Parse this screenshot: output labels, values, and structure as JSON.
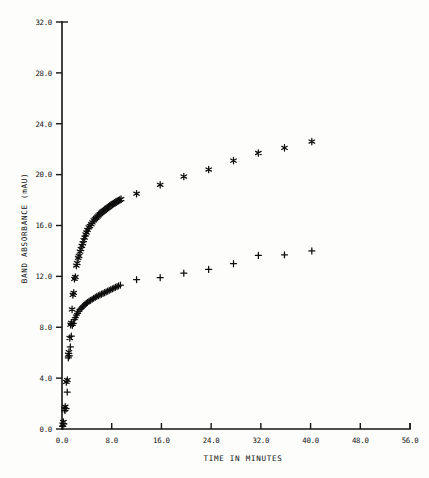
{
  "chart_data": {
    "type": "scatter",
    "title": "",
    "xlabel": "TIME IN MINUTES",
    "ylabel": "BAND ABSORBANCE (mAU)",
    "xlim": [
      0.0,
      56.0
    ],
    "ylim": [
      0.0,
      32.0
    ],
    "xticks": [
      "0.0",
      "8.0",
      "16.0",
      "24.0",
      "32.0",
      "40.0",
      "48.0",
      "56.0"
    ],
    "xtick_values": [
      0.0,
      8.0,
      16.0,
      24.0,
      32.0,
      40.0,
      48.0,
      56.0
    ],
    "yticks": [
      "0.0",
      "4.0",
      "8.0",
      "12.0",
      "16.0",
      "20.0",
      "24.0",
      "28.0",
      "32.0"
    ],
    "ytick_values": [
      0.0,
      4.0,
      8.0,
      12.0,
      16.0,
      20.0,
      24.0,
      28.0,
      32.0
    ],
    "grid": false,
    "legend": "none",
    "series": [
      {
        "name": "upper-series",
        "marker": "star",
        "points": [
          [
            0.1,
            0.35
          ],
          [
            0.22,
            0.55
          ],
          [
            0.38,
            1.55
          ],
          [
            0.52,
            1.75
          ],
          [
            0.7,
            3.7
          ],
          [
            0.86,
            3.85
          ],
          [
            1.0,
            5.85
          ],
          [
            1.12,
            6.05
          ],
          [
            1.25,
            7.15
          ],
          [
            1.38,
            8.2
          ],
          [
            1.5,
            8.35
          ],
          [
            1.62,
            9.4
          ],
          [
            1.75,
            10.55
          ],
          [
            1.88,
            10.7
          ],
          [
            2.0,
            11.8
          ],
          [
            2.15,
            11.95
          ],
          [
            2.3,
            12.85
          ],
          [
            2.45,
            13.05
          ],
          [
            2.6,
            13.45
          ],
          [
            2.75,
            13.6
          ],
          [
            2.9,
            13.95
          ],
          [
            3.05,
            14.15
          ],
          [
            3.2,
            14.4
          ],
          [
            3.35,
            14.6
          ],
          [
            3.5,
            14.85
          ],
          [
            3.65,
            15.05
          ],
          [
            3.8,
            15.3
          ],
          [
            3.95,
            15.45
          ],
          [
            4.1,
            15.65
          ],
          [
            4.3,
            15.85
          ],
          [
            4.5,
            15.95
          ],
          [
            4.7,
            16.1
          ],
          [
            4.9,
            16.25
          ],
          [
            5.1,
            16.4
          ],
          [
            5.3,
            16.5
          ],
          [
            5.5,
            16.6
          ],
          [
            5.7,
            16.7
          ],
          [
            5.9,
            16.8
          ],
          [
            6.1,
            16.9
          ],
          [
            6.3,
            17.0
          ],
          [
            6.5,
            17.08
          ],
          [
            6.7,
            17.15
          ],
          [
            6.9,
            17.22
          ],
          [
            7.1,
            17.3
          ],
          [
            7.3,
            17.38
          ],
          [
            7.5,
            17.45
          ],
          [
            7.7,
            17.52
          ],
          [
            7.9,
            17.6
          ],
          [
            8.1,
            17.66
          ],
          [
            8.3,
            17.72
          ],
          [
            8.5,
            17.78
          ],
          [
            8.7,
            17.84
          ],
          [
            8.9,
            17.9
          ],
          [
            9.1,
            17.96
          ],
          [
            9.3,
            18.02
          ],
          [
            9.5,
            18.08
          ],
          [
            12.0,
            18.5
          ],
          [
            15.8,
            19.2
          ],
          [
            19.6,
            19.85
          ],
          [
            23.6,
            20.4
          ],
          [
            27.6,
            21.1
          ],
          [
            31.6,
            21.7
          ],
          [
            35.8,
            22.1
          ],
          [
            40.2,
            22.6
          ]
        ]
      },
      {
        "name": "lower-series",
        "marker": "plus",
        "points": [
          [
            0.12,
            0.2
          ],
          [
            0.3,
            0.4
          ],
          [
            0.48,
            1.45
          ],
          [
            0.66,
            1.6
          ],
          [
            0.84,
            2.9
          ],
          [
            1.02,
            5.6
          ],
          [
            1.18,
            5.75
          ],
          [
            1.34,
            6.45
          ],
          [
            1.5,
            7.3
          ],
          [
            1.66,
            8.15
          ],
          [
            1.82,
            8.3
          ],
          [
            1.98,
            8.6
          ],
          [
            2.14,
            8.75
          ],
          [
            2.32,
            8.95
          ],
          [
            2.5,
            9.1
          ],
          [
            2.7,
            9.25
          ],
          [
            2.9,
            9.4
          ],
          [
            3.1,
            9.5
          ],
          [
            3.3,
            9.6
          ],
          [
            3.5,
            9.7
          ],
          [
            3.7,
            9.8
          ],
          [
            3.9,
            9.88
          ],
          [
            4.1,
            9.96
          ],
          [
            4.35,
            10.05
          ],
          [
            4.6,
            10.12
          ],
          [
            4.85,
            10.2
          ],
          [
            5.1,
            10.28
          ],
          [
            5.35,
            10.35
          ],
          [
            5.6,
            10.42
          ],
          [
            5.85,
            10.48
          ],
          [
            6.1,
            10.54
          ],
          [
            6.35,
            10.6
          ],
          [
            6.6,
            10.66
          ],
          [
            6.85,
            10.72
          ],
          [
            7.1,
            10.78
          ],
          [
            7.35,
            10.84
          ],
          [
            7.6,
            10.9
          ],
          [
            7.85,
            10.96
          ],
          [
            8.1,
            11.02
          ],
          [
            8.35,
            11.08
          ],
          [
            8.6,
            11.14
          ],
          [
            8.85,
            11.2
          ],
          [
            9.1,
            11.26
          ],
          [
            9.4,
            11.32
          ],
          [
            12.0,
            11.75
          ],
          [
            15.8,
            11.9
          ],
          [
            19.6,
            12.25
          ],
          [
            23.6,
            12.55
          ],
          [
            27.6,
            13.0
          ],
          [
            31.6,
            13.65
          ],
          [
            35.8,
            13.7
          ],
          [
            40.2,
            14.0
          ]
        ]
      }
    ]
  }
}
